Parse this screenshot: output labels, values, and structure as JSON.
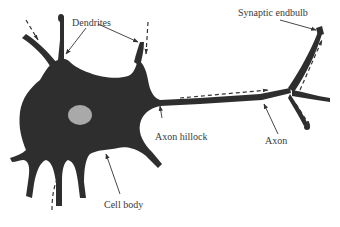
{
  "diagram": {
    "labels": {
      "dendrites": "Dendrites",
      "synaptic_endbulb": "Synaptic endbulb",
      "axon_hillock": "Axon hillock",
      "axon": "Axon",
      "cell_body": "Cell body"
    },
    "colors": {
      "cell_fill": "#2e2e2e",
      "nucleus_fill": "#a9a9a9",
      "arrow": "#333333",
      "label_text": "#3a3a3a",
      "background": "#ffffff"
    },
    "signal_direction": "dashed arrows from dendrites toward cell body, along axon toward synaptic endbulbs"
  }
}
